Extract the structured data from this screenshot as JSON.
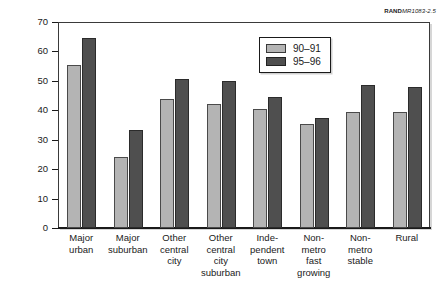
{
  "figure_id": {
    "mark": "RAND",
    "number": "MR1083-2.5"
  },
  "legend": {
    "position": "top-right-inside",
    "entries": [
      {
        "label": "90–91",
        "color": "#b4b4b4"
      },
      {
        "label": "95–96",
        "color": "#4f4f4f"
      }
    ]
  },
  "chart_data": {
    "type": "bar",
    "title": "",
    "xlabel": "",
    "ylabel": "Percentage of students",
    "ylim": [
      0,
      70
    ],
    "yticks": [
      0,
      10,
      20,
      30,
      40,
      50,
      60,
      70
    ],
    "ytick_labels": [
      "0",
      "10",
      "20",
      "30",
      "40",
      "50",
      "60",
      "70"
    ],
    "grid": false,
    "categories": [
      "Major urban",
      "Major suburban",
      "Other central city",
      "Other central city suburban",
      "Independent town",
      "Non-metro fast growing",
      "Non-metro stable",
      "Rural"
    ],
    "category_label_lines": [
      [
        "Major",
        "urban"
      ],
      [
        "Major",
        "suburban"
      ],
      [
        "Other",
        "central",
        "city"
      ],
      [
        "Other",
        "central",
        "city",
        "suburban"
      ],
      [
        "Inde-",
        "pendent",
        "town"
      ],
      [
        "Non-",
        "metro",
        "fast",
        "growing"
      ],
      [
        "Non-",
        "metro",
        "stable"
      ],
      [
        "Rural"
      ]
    ],
    "series": [
      {
        "name": "90–91",
        "color": "#b4b4b4",
        "values": [
          55.5,
          24.0,
          44.0,
          42.0,
          40.3,
          35.4,
          39.5,
          39.5
        ]
      },
      {
        "name": "95–96",
        "color": "#4f4f4f",
        "values": [
          64.5,
          33.2,
          50.7,
          49.8,
          44.5,
          37.5,
          48.6,
          48.0
        ]
      }
    ]
  }
}
